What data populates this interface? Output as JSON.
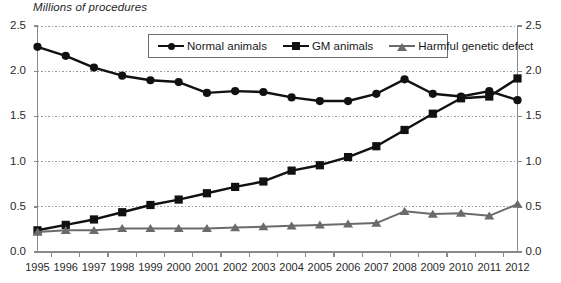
{
  "chart_data": {
    "type": "line",
    "title": "",
    "ylabel": "Millions of procedures",
    "xlabel": "",
    "ylim": [
      0.0,
      2.5
    ],
    "ylim_right": [
      0.0,
      2.5
    ],
    "grid": true,
    "legend_position": "top-center",
    "ytick_labels": [
      "2.5",
      "2.0",
      "1.5",
      "1.0",
      "0.5",
      "0.0"
    ],
    "ytick_values": [
      2.5,
      2.0,
      1.5,
      1.0,
      0.5,
      0.0
    ],
    "ytick_labels_right": [
      "2.5",
      "2.0",
      "1.5",
      "1.0",
      "0.5",
      "0.0"
    ],
    "categories": [
      "1995",
      "1996",
      "1997",
      "1998",
      "1999",
      "2000",
      "2001",
      "2002",
      "2003",
      "2004",
      "2005",
      "2006",
      "2007",
      "2008",
      "2009",
      "2010",
      "2011",
      "2012"
    ],
    "x": [
      1995,
      1996,
      1997,
      1998,
      1999,
      2000,
      2001,
      2002,
      2003,
      2004,
      2005,
      2006,
      2007,
      2008,
      2009,
      2010,
      2011,
      2012
    ],
    "series": [
      {
        "name": "Normal animals",
        "marker": "circle",
        "color": "#111111",
        "values": [
          2.27,
          2.17,
          2.04,
          1.95,
          1.9,
          1.88,
          1.76,
          1.78,
          1.77,
          1.71,
          1.67,
          1.67,
          1.75,
          1.91,
          1.75,
          1.72,
          1.78,
          1.68
        ]
      },
      {
        "name": "GM animals",
        "marker": "square",
        "color": "#111111",
        "values": [
          0.24,
          0.3,
          0.36,
          0.44,
          0.52,
          0.58,
          0.65,
          0.72,
          0.78,
          0.9,
          0.96,
          1.05,
          1.17,
          1.35,
          1.53,
          1.7,
          1.72,
          1.92
        ]
      },
      {
        "name": "Harmful genetic defect",
        "marker": "triangle",
        "color": "#6b6b6b",
        "values": [
          0.22,
          0.24,
          0.24,
          0.26,
          0.26,
          0.26,
          0.26,
          0.27,
          0.28,
          0.29,
          0.3,
          0.31,
          0.32,
          0.45,
          0.42,
          0.43,
          0.4,
          0.53
        ]
      }
    ]
  },
  "legend": {
    "items": [
      {
        "label": "Normal animals"
      },
      {
        "label": "GM animals"
      },
      {
        "label": "Harmful genetic defect"
      }
    ]
  },
  "colors": {
    "normal_animals": "#111111",
    "gm_animals": "#111111",
    "harmful_genetic_defect": "#6b6b6b",
    "axis": "#8a8a8a",
    "gridline": "#9a9a9a"
  }
}
